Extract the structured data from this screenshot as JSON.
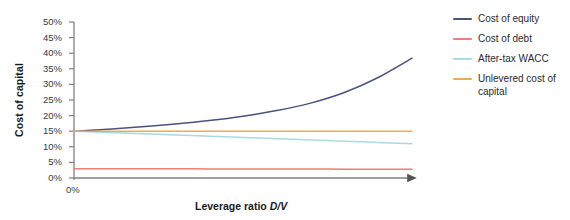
{
  "chart_data": {
    "type": "line",
    "title": "",
    "xlabel": "Leverage ratio D/V",
    "xlabel_plain": "Leverage ratio ",
    "xlabel_italic": "D/V",
    "ylabel": "Cost of capital",
    "xlim": [
      0,
      1
    ],
    "ylim": [
      0,
      0.5
    ],
    "grid": false,
    "legend_position": "right",
    "x_tick_labels": [
      "0%"
    ],
    "x_tick_values": [
      0
    ],
    "y_tick_labels": [
      "0%",
      "5%",
      "10%",
      "15%",
      "20%",
      "25%",
      "30%",
      "35%",
      "40%",
      "45%",
      "50%"
    ],
    "y_tick_values": [
      0,
      5,
      10,
      15,
      20,
      25,
      30,
      35,
      40,
      45,
      50
    ],
    "x": [
      0,
      0.1,
      0.2,
      0.3,
      0.4,
      0.5,
      0.6,
      0.7,
      0.8,
      0.9,
      1.0
    ],
    "series": [
      {
        "name": "Cost of equity",
        "color": "#4a5280",
        "values": [
          15.0,
          15.6,
          16.4,
          17.3,
          18.4,
          19.8,
          21.6,
          24.0,
          27.4,
          32.2,
          38.4
        ]
      },
      {
        "name": "Cost of debt",
        "color": "#ef7f72",
        "values": [
          3.0,
          2.98,
          2.96,
          2.94,
          2.92,
          2.9,
          2.88,
          2.86,
          2.84,
          2.82,
          2.8
        ]
      },
      {
        "name": "After-tax WACC",
        "color": "#a9d9e8",
        "values": [
          15.0,
          14.6,
          14.2,
          13.8,
          13.4,
          13.0,
          12.6,
          12.2,
          11.8,
          11.4,
          11.0
        ]
      },
      {
        "name": "Unlevered cost of capital",
        "color": "#f5a94e",
        "values": [
          15.0,
          15.0,
          15.0,
          15.0,
          15.0,
          15.0,
          15.0,
          15.0,
          15.0,
          15.0,
          15.0
        ]
      }
    ]
  },
  "legend": {
    "entries": [
      {
        "label": "Cost of equity",
        "color": "#4a5280"
      },
      {
        "label": "Cost of debt",
        "color": "#ef7f72"
      },
      {
        "label": "After-tax WACC",
        "color": "#a9d9e8"
      },
      {
        "label": "Unlevered cost of capital",
        "color": "#f5a94e"
      }
    ]
  },
  "axes": {
    "axis_color": "#808080",
    "tick_color": "#808080"
  }
}
